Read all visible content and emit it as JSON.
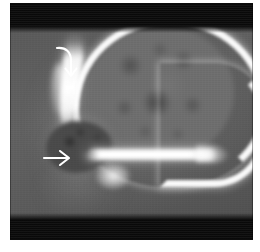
{
  "figure": {
    "modality": "CT",
    "view": "axial brain slice",
    "title": "Axial CT head image",
    "background_color": "#ffffff",
    "plate": {
      "width_px": 243,
      "height_px": 237,
      "tissue_color": "#5d5d5d",
      "bone_color": "#ffffff",
      "letterbox_color": "#0a0a0a"
    },
    "bands": {
      "top_label": "top letterbox band",
      "bottom_label": "bottom letterbox band"
    },
    "structures": [
      {
        "name": "calvarium",
        "label": "bright skull arc",
        "color": "#fafafa"
      },
      {
        "name": "brain-parenchyma",
        "label": "mottled grey brain tissue",
        "color": "#6e6e6e"
      },
      {
        "name": "skull-base-band",
        "label": "bright horizontal skull base band",
        "color": "#ffffff"
      },
      {
        "name": "frontal-bone-strip",
        "label": "bright anterior bone strip",
        "color": "#ffffff"
      },
      {
        "name": "mass-lesion",
        "label": "dark mottled mass",
        "color": "#4a4a4a"
      },
      {
        "name": "scalp-soft-tissue",
        "label": "outer soft tissue contour",
        "color": "#8c8c8c"
      }
    ],
    "annotations": [
      {
        "id": "curved-arrow",
        "shape": "curved down arrow",
        "color": "#ffffff",
        "points_to": "frontal bone / anterior calvarial abnormality",
        "position": {
          "x": 44,
          "y": 42
        }
      },
      {
        "id": "straight-arrow",
        "shape": "right pointing arrow",
        "color": "#ffffff",
        "points_to": "mass lesion",
        "position": {
          "x": 32,
          "y": 144
        }
      }
    ]
  }
}
